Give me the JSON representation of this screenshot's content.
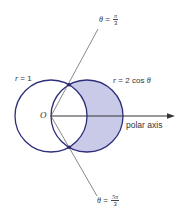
{
  "diagram": {
    "type": "polar-curves",
    "colors": {
      "curve_stroke": "#2e2e7a",
      "ray_stroke": "#555555",
      "axis_stroke": "#333333",
      "shaded_fill": "#c9c9e8",
      "intersection_point": "#2a2a6e",
      "text": "#333333"
    },
    "curves": [
      {
        "id": "circle-r1",
        "equation_lhs": "r",
        "equation_eq": "=",
        "equation_rhs": "1"
      },
      {
        "id": "circle-2cos",
        "equation_lhs": "r",
        "equation_eq": "=",
        "equation_rhs_num": "2",
        "equation_rhs_func": "cos",
        "equation_rhs_var": "θ"
      }
    ],
    "rays": [
      {
        "id": "ray-pi-over-3",
        "var": "θ",
        "eq": "=",
        "num": "π",
        "den": "3"
      },
      {
        "id": "ray-5pi-over-3",
        "var": "θ",
        "eq": "=",
        "num": "5π",
        "den": "3"
      }
    ],
    "origin_label": "O",
    "axis_label": "polar axis",
    "shaded_region": "inside r = 2 cos θ and outside r = 1"
  }
}
